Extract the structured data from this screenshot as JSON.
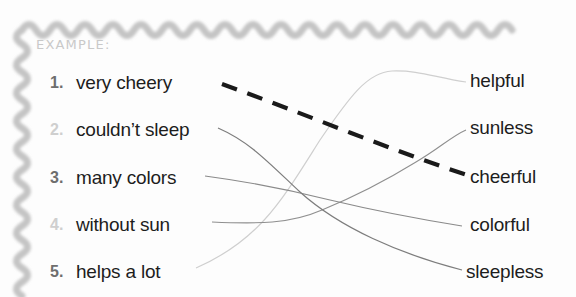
{
  "worksheet": {
    "example_label": "EXAMPLE:",
    "left_items": [
      {
        "number": "1.",
        "text": "very cheery",
        "dim": false,
        "y": 83
      },
      {
        "number": "2.",
        "text": "couldn’t sleep",
        "dim": true,
        "y": 130
      },
      {
        "number": "3.",
        "text": "many colors",
        "dim": false,
        "y": 178
      },
      {
        "number": "4.",
        "text": "without sun",
        "dim": true,
        "y": 225
      },
      {
        "number": "5.",
        "text": "helps a lot",
        "dim": false,
        "y": 272
      }
    ],
    "right_words": [
      {
        "text": "helpful",
        "y": 81
      },
      {
        "text": "sunless",
        "y": 128
      },
      {
        "text": "cheerful",
        "y": 177
      },
      {
        "text": "colorful",
        "y": 225
      },
      {
        "text": "sleepless",
        "y": 272
      }
    ],
    "connections": [
      {
        "from": "very cheery",
        "to": "cheerful",
        "style": "dashed-example"
      },
      {
        "from": "couldn’t sleep",
        "to": "sleepless",
        "style": "thin-curve"
      },
      {
        "from": "many colors",
        "to": "colorful",
        "style": "thin-curve"
      },
      {
        "from": "without sun",
        "to": "sunless",
        "style": "thin-curve"
      },
      {
        "from": "helps a lot",
        "to": "helpful",
        "style": "thin-curve"
      }
    ],
    "colors": {
      "border": "#c4c4c4",
      "number_strong": "#6e6e6e",
      "number_faded": "#cfcfcf",
      "text": "#1d1d1d",
      "example_text": "#c9c9c9",
      "line": "#8a8a8a",
      "example_line": "#1a1a1a",
      "page_background": "#fdfdfd"
    }
  }
}
